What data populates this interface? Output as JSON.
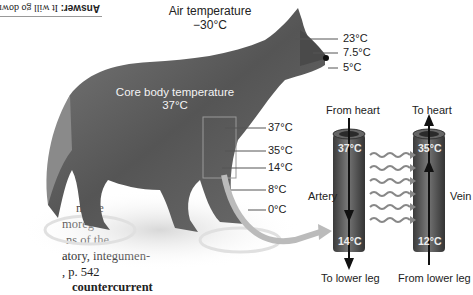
{
  "answer_box": {
    "bold": "Answer:",
    "text": " It will go down.",
    "orientation": "upside-down"
  },
  "body_text": {
    "lines": [
      "ture,",
      "the",
      "the",
      ".3).",
      "nav-",
      "n  to",
      "move",
      "moreg-",
      "ns  of  the",
      "atory,  integumen-",
      ", p. 542",
      "countercurrent"
    ]
  },
  "figure": {
    "air_temperature": {
      "label": "Air temperature",
      "value": "−30°C"
    },
    "core_body_temperature": {
      "label": "Core body temperature",
      "value": "37°C"
    },
    "head_temps": [
      "23°C",
      "7.5°C",
      "5°C"
    ],
    "leg_temps": [
      "37°C",
      "35°C",
      "14°C",
      "8°C",
      "0°C"
    ],
    "exchange": {
      "from_heart": "From heart",
      "to_heart": "To heart",
      "artery_label": "Artery",
      "vein_label": "Vein",
      "artery_top_temp": "37°C",
      "artery_bottom_temp": "14°C",
      "vein_top_temp": "35°C",
      "vein_bottom_temp": "12°C",
      "to_lower_leg": "To lower leg",
      "from_lower_leg": "From lower leg",
      "heat_arrows": 6
    },
    "colors": {
      "vessel": "#555555",
      "vessel_dark": "#333333",
      "heat_arrow": "#888888",
      "callout_arrow": "#bbbbbb",
      "wolf": "#6a6a6a",
      "line": "#555555"
    }
  }
}
